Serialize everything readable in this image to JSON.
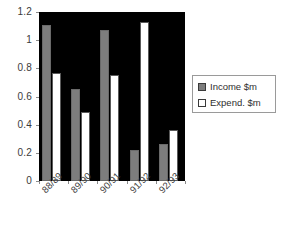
{
  "chart_data": {
    "type": "bar",
    "title": "",
    "subtitle": "",
    "xlabel": "",
    "ylabel": "",
    "categories": [
      "88/89",
      "89/90",
      "90/91",
      "91/92",
      "92/93"
    ],
    "series": [
      {
        "name": "Income $m",
        "color": "#7d7d7d",
        "values": [
          1.11,
          0.65,
          1.07,
          0.22,
          0.26
        ]
      },
      {
        "name": "Expend. $m",
        "color": "#ffffff",
        "values": [
          0.77,
          0.49,
          0.75,
          1.13,
          0.36
        ]
      }
    ],
    "ylim": [
      0,
      1.2
    ],
    "ytick_labels": [
      "1.2",
      "1",
      "0.8",
      "0.6",
      "0.4",
      "0.2",
      "0"
    ],
    "ytick_values": [
      1.2,
      1.0,
      0.8,
      0.6,
      0.4,
      0.2,
      0
    ],
    "grid": false,
    "legend_position": "right",
    "plot_background": "#000000",
    "page_background": "#ffffff",
    "xtick_label_rotation": -45
  },
  "legend": {
    "entries": [
      {
        "label": "Income $m",
        "swatch": "income-swatch"
      },
      {
        "label": "Expend. $m",
        "swatch": "expend-swatch"
      }
    ]
  }
}
